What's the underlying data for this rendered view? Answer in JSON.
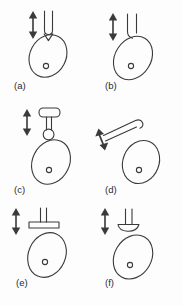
{
  "figure": {
    "width": 182,
    "height": 306,
    "background_color": "#fdfdfd",
    "line_color": "#3a3a3a",
    "label_color": "#2b2b2b",
    "arrow_label": "double-headed arrow indicating direction of movement",
    "egg_label": "egg",
    "nucleus_label": "nucleus"
  },
  "panels": [
    {
      "id": "a",
      "label": "(a)",
      "tool": "u-shaped-probe-with-pointed-tip",
      "arrow": "vertical-double-arrow",
      "arrow_direction": "vertical",
      "contact": "top"
    },
    {
      "id": "b",
      "label": "(b)",
      "tool": "two-pronged-fork-probe",
      "arrow": "vertical-double-arrow",
      "arrow_direction": "vertical",
      "contact": "top"
    },
    {
      "id": "c",
      "label": "(c)",
      "tool": "t-shaped-probe-with-ring-loop",
      "arrow": "vertical-double-arrow",
      "arrow_direction": "vertical",
      "contact": "top"
    },
    {
      "id": "d",
      "label": "(d)",
      "tool": "angled-two-pronged-probe",
      "arrow": "diagonal-double-arrow",
      "arrow_direction": "diagonal",
      "contact": "upper-left"
    },
    {
      "id": "e",
      "label": "(e)",
      "tool": "flat-plate-probe-with-two-prongs",
      "arrow": "vertical-double-arrow",
      "arrow_direction": "vertical",
      "contact": "top"
    },
    {
      "id": "f",
      "label": "(f)",
      "tool": "curved-blade-probe-with-stem",
      "arrow": "vertical-double-arrow",
      "arrow_direction": "vertical",
      "contact": "top-left"
    }
  ]
}
